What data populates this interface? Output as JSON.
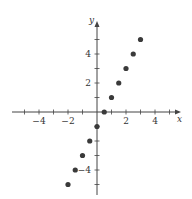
{
  "chart_data": {
    "type": "scatter",
    "title": "",
    "xlabel": "x",
    "ylabel": "y",
    "xlim": [
      -5.5,
      5.8
    ],
    "ylim": [
      -5.5,
      6.5
    ],
    "grid": false,
    "x_ticks": [
      -5,
      -4,
      -3,
      -2,
      -1,
      1,
      2,
      3,
      4,
      5
    ],
    "x_tick_labels": [
      "-4",
      "-2",
      "2",
      "4"
    ],
    "x_tick_label_values": [
      -4,
      -2,
      2,
      4
    ],
    "y_ticks": [
      -5,
      -4,
      -3,
      -2,
      -1,
      1,
      2,
      3,
      4,
      5
    ],
    "y_tick_labels": [
      "4",
      "2",
      "-4"
    ],
    "y_tick_label_values": [
      4,
      2,
      -4
    ],
    "series": [
      {
        "name": "points",
        "x": [
          -2,
          -1.5,
          -1,
          -0.5,
          0,
          0.5,
          1,
          1.5,
          2,
          2.5,
          3
        ],
        "y": [
          -5,
          -4,
          -3,
          -2,
          -1,
          0,
          1,
          2,
          3,
          4,
          5
        ]
      }
    ],
    "colors": {
      "axis": "#444444",
      "point": "#3a3a3a"
    }
  }
}
